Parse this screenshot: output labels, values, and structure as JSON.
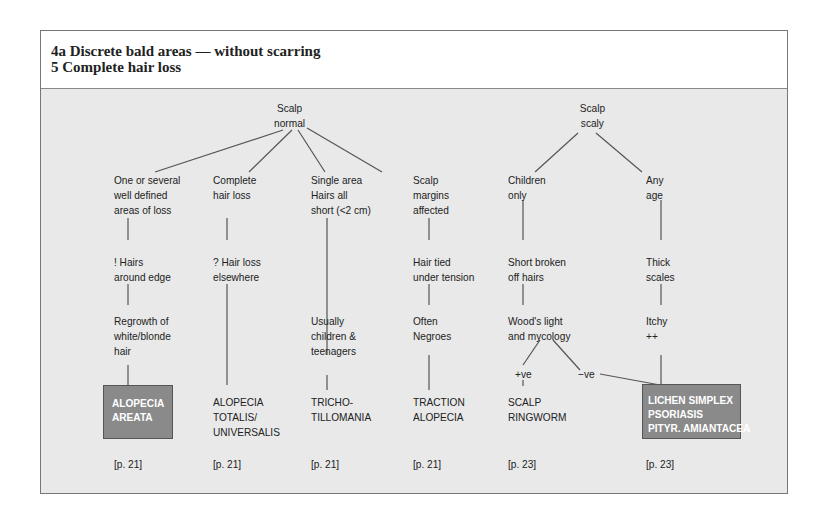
{
  "header": {
    "line1": "4a  Discrete bald areas — without scarring",
    "line2": "5  Complete hair loss"
  },
  "roots": {
    "normal": [
      "Scalp",
      "normal"
    ],
    "scaly": [
      "Scalp",
      "scaly"
    ]
  },
  "branches": [
    {
      "id": "areata",
      "steps": [
        [
          "One or several",
          "well defined",
          "areas of loss"
        ],
        [
          "! Hairs",
          "around edge"
        ],
        [
          "Regrowth of",
          "white/blonde",
          "hair"
        ]
      ],
      "diagnosis": [
        "ALOPECIA",
        "AREATA"
      ],
      "highlighted": true,
      "ref": "[p. 21]"
    },
    {
      "id": "totalis",
      "steps": [
        [
          "Complete",
          "hair loss"
        ],
        [
          "? Hair loss",
          "elsewhere"
        ]
      ],
      "diagnosis": [
        "ALOPECIA",
        "TOTALIS/",
        "UNIVERSALIS"
      ],
      "highlighted": false,
      "ref": "[p. 21]"
    },
    {
      "id": "tricho",
      "steps": [
        [
          "Single area",
          "Hairs all",
          "short (<2 cm)"
        ],
        [
          "Usually",
          "children &",
          "teenagers"
        ]
      ],
      "diagnosis": [
        "TRICHO-",
        "TILLOMANIA"
      ],
      "highlighted": false,
      "ref": "[p. 21]"
    },
    {
      "id": "traction",
      "steps": [
        [
          "Scalp",
          "margins",
          "affected"
        ],
        [
          "Hair tied",
          "under tension"
        ],
        [
          "Often",
          "Negroes"
        ]
      ],
      "diagnosis": [
        "TRACTION",
        "ALOPECIA"
      ],
      "highlighted": false,
      "ref": "[p. 21]"
    },
    {
      "id": "ringworm",
      "steps": [
        [
          "Children",
          "only"
        ],
        [
          "Short broken",
          "off hairs"
        ],
        [
          "Wood's light",
          "and mycology"
        ]
      ],
      "positive": "+ve",
      "negative": "−ve",
      "diagnosis": [
        "SCALP",
        "RINGWORM"
      ],
      "highlighted": false,
      "ref": "[p. 23]"
    },
    {
      "id": "lichen",
      "steps": [
        [
          "Any",
          "age"
        ],
        [
          "Thick",
          "scales"
        ],
        [
          "Itchy",
          "++"
        ]
      ],
      "diagnosis": [
        "LICHEN SIMPLEX",
        "PSORIASIS",
        "PITYR. AMIANTACEA"
      ],
      "highlighted": true,
      "ref": "[p. 23]"
    }
  ],
  "colors": {
    "panel_bg": "#e9e9e9",
    "box_fill": "#8a8a8a",
    "box_text": "#ffffff",
    "line": "#555555"
  }
}
